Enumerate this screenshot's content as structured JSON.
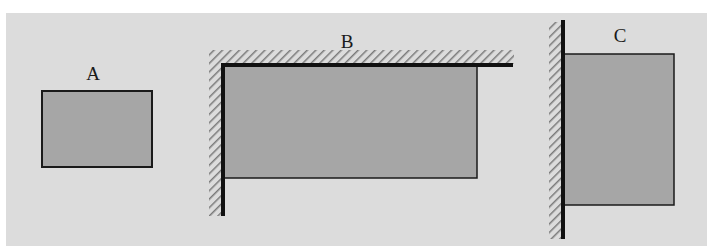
{
  "diagram": {
    "colors": {
      "background": "#ffffff",
      "panel": "#dcdcdc",
      "plate_fill": "#a6a6a6",
      "outline": "#1a1a1a",
      "hatch": "#7a7a7a"
    },
    "figures": [
      {
        "label": "A",
        "support": "free (no walls)"
      },
      {
        "label": "B",
        "support": "fixed on left and top edges (corner walls)"
      },
      {
        "label": "C",
        "support": "fixed on left edge (single wall)"
      }
    ]
  }
}
